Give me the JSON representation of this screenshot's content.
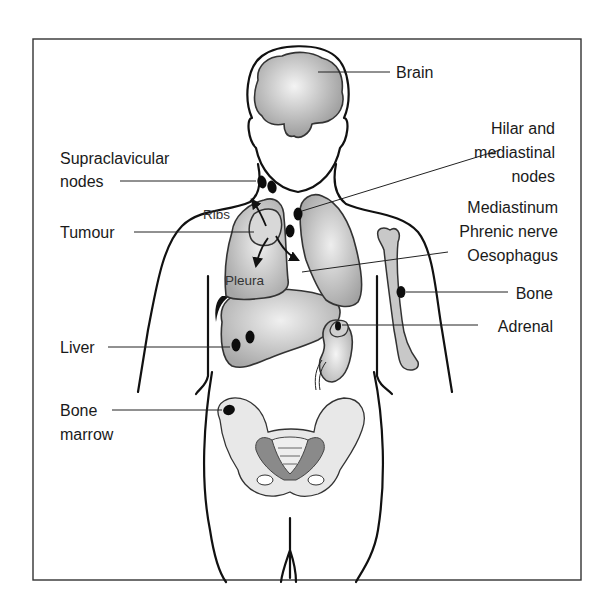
{
  "figure": {
    "labels": {
      "brain": "Brain",
      "hilar_line1": "Hilar and",
      "hilar_line2": "mediastinal",
      "hilar_line3": "nodes",
      "supraclavicular_line1": "Supraclavicular",
      "supraclavicular_line2": "nodes",
      "mediastinum": "Mediastinum",
      "phrenic": "Phrenic nerve",
      "oesophagus": "Oesophagus",
      "tumour": "Tumour",
      "ribs": "Ribs",
      "pleura": "Pleura",
      "bone": "Bone",
      "adrenal": "Adrenal",
      "liver": "Liver",
      "bone_marrow_line1": "Bone",
      "bone_marrow_line2": "marrow"
    },
    "colors": {
      "outline": "#111111",
      "organ_fill": "#b5b5b5",
      "organ_highlight": "#f2f2f2",
      "bone_fill": "#c8c8c8",
      "pelvis_fill": "#e8e8e8",
      "pelvis_dark": "#8a8a8a",
      "metastasis": "#0d0d0d"
    }
  }
}
